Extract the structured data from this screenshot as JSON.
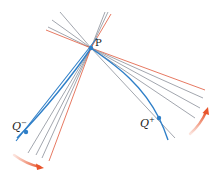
{
  "diagram": {
    "colors": {
      "curve": "#2f7fc8",
      "secant": "#8a8f99",
      "limit_line": "#e0573a",
      "arrow": "#e8552c",
      "point": "#2f7fc8"
    },
    "points": {
      "P": {
        "label": "P",
        "x": 91,
        "y": 48
      },
      "Q_minus": {
        "label": "Q",
        "sup": "−",
        "x": 26,
        "y": 132
      },
      "Q_plus": {
        "label": "Q",
        "sup": "+",
        "x": 159,
        "y": 118
      }
    },
    "left_fan": {
      "limit_line": {
        "x1": 48,
        "y1": 30,
        "x2": 49,
        "y2": 161
      },
      "secants": [
        {
          "x1": 58,
          "y1": 12,
          "x2": 28,
          "y2": 153
        },
        {
          "x1": 52,
          "y1": 19,
          "x2": 36,
          "y2": 155
        },
        {
          "x1": 48,
          "y1": 24,
          "x2": 42,
          "y2": 158
        }
      ]
    },
    "right_fan": {
      "limit_line": {
        "x1": 205,
        "y1": 90
      },
      "secants": [
        {
          "x1": 203,
          "y1": 98
        },
        {
          "x1": 200,
          "y1": 108
        },
        {
          "x1": 195,
          "y1": 118
        },
        {
          "x1": 175,
          "y1": 138
        }
      ]
    },
    "arrows": [
      {
        "name": "arrow-left-motion",
        "from": [
          14,
          155
        ],
        "to": [
          42,
          168
        ]
      },
      {
        "name": "arrow-right-motion",
        "from": [
          190,
          133
        ],
        "to": [
          208,
          109
        ]
      }
    ]
  }
}
